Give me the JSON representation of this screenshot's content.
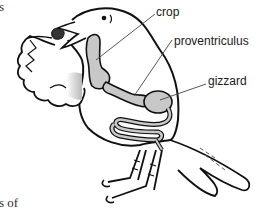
{
  "diagram": {
    "labels": {
      "crop": "crop",
      "proventriculus": "proventriculus",
      "gizzard": "gizzard"
    },
    "text_fragments": {
      "top_left": "s",
      "bottom_left": "s of"
    },
    "colors": {
      "outline": "#111111",
      "organ_fill": "#c8c8c8",
      "shade": "#bdbdbd",
      "leader_line": "#444444",
      "background": "#ffffff"
    }
  }
}
